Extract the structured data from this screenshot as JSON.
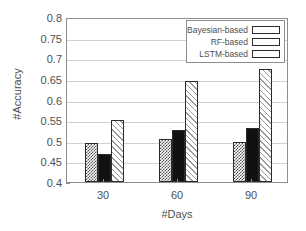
{
  "chart_data": {
    "type": "bar",
    "title": "",
    "xlabel": "#Days",
    "ylabel": "#Accuracy",
    "categories": [
      "30",
      "60",
      "90"
    ],
    "series": [
      {
        "name": "Bayesian-based",
        "values": [
          0.495,
          0.505,
          0.498
        ],
        "pattern": "pat-dots",
        "color": "#555555"
      },
      {
        "name": "RF-based",
        "values": [
          0.467,
          0.526,
          0.531
        ],
        "pattern": "pat-solid",
        "color": "#111111"
      },
      {
        "name": "LSTM-based",
        "values": [
          0.551,
          0.645,
          0.673
        ],
        "pattern": "pat-diag",
        "color": "#9a9a9a"
      }
    ],
    "ylim": [
      0.4,
      0.8
    ],
    "yticks": [
      "0.4",
      "0.45",
      "0.5",
      "0.55",
      "0.6",
      "0.65",
      "0.7",
      "0.75",
      "0.8"
    ],
    "grid": true,
    "legend_position": "top-right",
    "axis_color": "#8e8e8e",
    "grid_color": "#d0d0d0"
  }
}
